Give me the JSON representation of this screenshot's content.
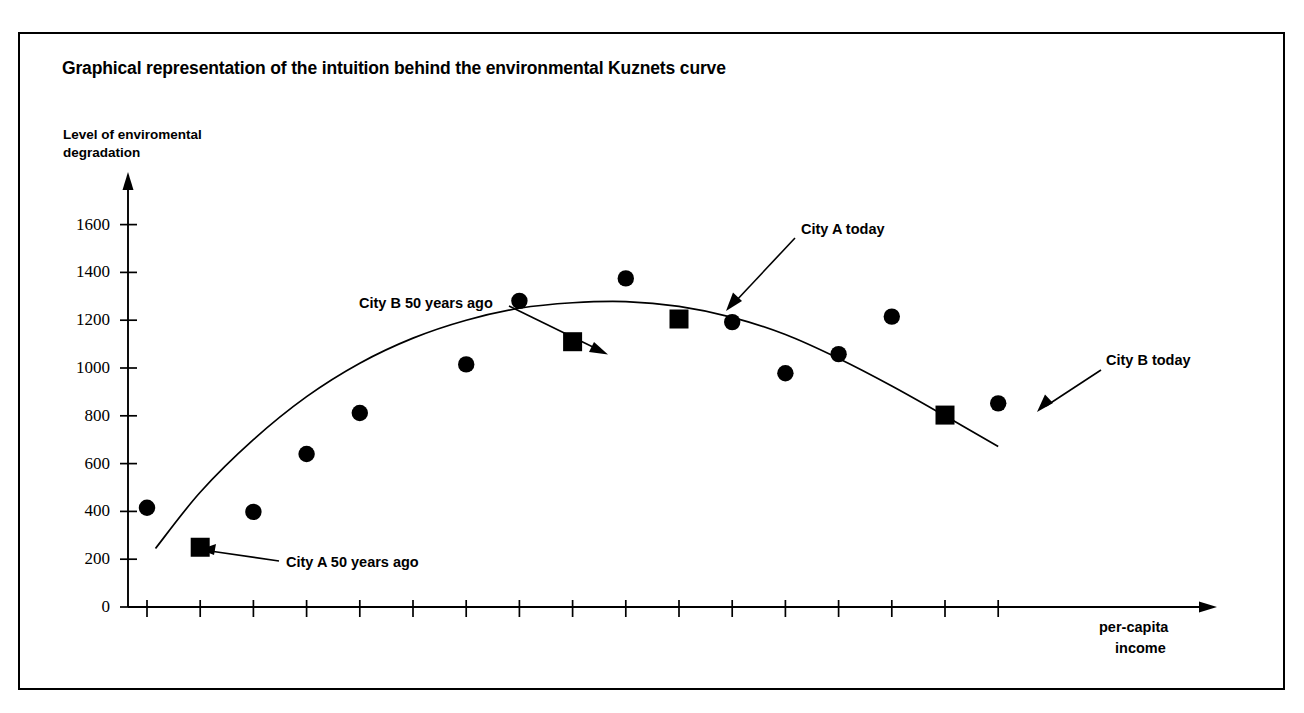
{
  "chart_title": "Graphical representation of the intuition behind the environmental Kuznets curve",
  "axes": {
    "y_title_line1": "Level of enviromental",
    "y_title_line2": "degradation",
    "x_title_line1": "per-capita",
    "x_title_line2": "income",
    "y_ticks": [
      "0",
      "200",
      "400",
      "600",
      "800",
      "1000",
      "1200",
      "1400",
      "1600"
    ],
    "x_ticks": [
      "3000",
      "3500",
      "4000",
      "4500",
      "5000",
      "5500",
      "6000",
      "6500",
      "7000",
      "7500",
      "8000",
      "8500",
      "9000",
      "9500",
      "10000",
      "10500",
      "11000"
    ]
  },
  "annotations": {
    "city_a_50": "City A 50 years ago",
    "city_b_50": "City B 50 years ago",
    "city_a_today": "City A today",
    "city_b_today": "City B today"
  },
  "colors": {
    "ink": "#000000",
    "paper": "#ffffff"
  },
  "chart_data": {
    "type": "scatter",
    "title": "Graphical representation of the intuition behind the environmental Kuznets curve",
    "xlabel": "per-capita income",
    "ylabel": "Level of enviromental degradation",
    "xlim": [
      2800,
      11400
    ],
    "ylim": [
      0,
      1700
    ],
    "grid": false,
    "legend": "none",
    "series": [
      {
        "name": "cities (circle markers)",
        "marker": "circle",
        "points": [
          {
            "x": 3000,
            "y": 415
          },
          {
            "x": 4000,
            "y": 398
          },
          {
            "x": 4500,
            "y": 640
          },
          {
            "x": 5000,
            "y": 812
          },
          {
            "x": 6000,
            "y": 1015
          },
          {
            "x": 6500,
            "y": 1281
          },
          {
            "x": 7500,
            "y": 1375
          },
          {
            "x": 8500,
            "y": 1192
          },
          {
            "x": 9000,
            "y": 978
          },
          {
            "x": 9500,
            "y": 1058
          },
          {
            "x": 10000,
            "y": 1215
          },
          {
            "x": 11000,
            "y": 852
          }
        ]
      },
      {
        "name": "highlighted cities (square markers)",
        "marker": "square",
        "points": [
          {
            "x": 3500,
            "y": 250,
            "label": "City A 50 years ago"
          },
          {
            "x": 7000,
            "y": 1110,
            "label": "City B 50 years ago"
          },
          {
            "x": 8000,
            "y": 1205,
            "label": "City A today"
          },
          {
            "x": 10500,
            "y": 803,
            "label": "City B today"
          }
        ]
      },
      {
        "name": "fitted Kuznets curve",
        "marker": "none",
        "type": "line",
        "points": [
          {
            "x": 3080,
            "y": 245
          },
          {
            "x": 3500,
            "y": 480
          },
          {
            "x": 4000,
            "y": 700
          },
          {
            "x": 4500,
            "y": 880
          },
          {
            "x": 5000,
            "y": 1020
          },
          {
            "x": 5500,
            "y": 1125
          },
          {
            "x": 6000,
            "y": 1200
          },
          {
            "x": 6500,
            "y": 1250
          },
          {
            "x": 7000,
            "y": 1273
          },
          {
            "x": 7500,
            "y": 1278
          },
          {
            "x": 8000,
            "y": 1258
          },
          {
            "x": 8500,
            "y": 1212
          },
          {
            "x": 9000,
            "y": 1140
          },
          {
            "x": 9500,
            "y": 1040
          },
          {
            "x": 10000,
            "y": 925
          },
          {
            "x": 10500,
            "y": 800
          },
          {
            "x": 11000,
            "y": 672
          }
        ]
      }
    ]
  }
}
